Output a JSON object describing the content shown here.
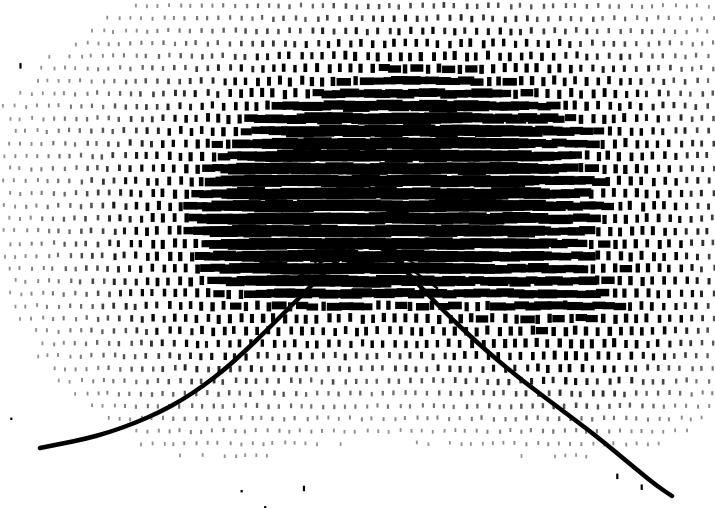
{
  "figure": {
    "title": "",
    "kind": "stipple-density-field-with-overlaid-curve",
    "width": 715,
    "height": 508,
    "background_color": "#ffffff",
    "ink_color": "#000000",
    "has_axes": false,
    "has_tick_labels": false,
    "has_legend": false,
    "has_text_labels": false
  },
  "chart_data": {
    "type": "scatter",
    "title": "",
    "subtitle": "",
    "xlabel": "",
    "ylabel": "",
    "xlim": [
      0,
      715
    ],
    "ylim": [
      508,
      0
    ],
    "grid": false,
    "legend_position": "none",
    "annotations": [],
    "series": [
      {
        "name": "density-stipple-field",
        "render": "dash-marks",
        "mark_shape": "vertical-dash",
        "mark_width_px": 3,
        "mark_height_px": 7,
        "grid_pitch_x": 11,
        "grid_pitch_y": 12.5,
        "color": "#000000",
        "field_model": "anisotropic-gaussian-blob-sum",
        "blobs": [
          {
            "cx": 415,
            "cy": 175,
            "sx": 255,
            "sy": 135,
            "amp": 0.78
          },
          {
            "cx": 370,
            "cy": 215,
            "sx": 175,
            "sy": 110,
            "amp": 0.72
          },
          {
            "cx": 350,
            "cy": 205,
            "sx": 95,
            "sy": 62,
            "amp": 1.05
          },
          {
            "cx": 320,
            "cy": 230,
            "sx": 62,
            "sy": 40,
            "amp": 0.95
          },
          {
            "cx": 470,
            "cy": 120,
            "sx": 190,
            "sy": 95,
            "amp": 0.42
          },
          {
            "cx": 610,
            "cy": 300,
            "sx": 110,
            "sy": 90,
            "amp": 0.4
          },
          {
            "cx": 215,
            "cy": 300,
            "sx": 120,
            "sy": 110,
            "amp": 0.38
          },
          {
            "cx": 540,
            "cy": 330,
            "sx": 130,
            "sy": 85,
            "amp": 0.3
          }
        ],
        "saturation_threshold": 0.86,
        "stripe_period_y": 12.5,
        "noise_amount": 0.3,
        "sparse_outlier_count": 95
      }
    ],
    "overlay_curve": {
      "name": "peak-curve",
      "render": "thick-stroke",
      "stroke_width_px": 4.5,
      "color": "#000000",
      "description": "smooth single-peaked curve rising from lower-left, apex near center, descending to lower-right",
      "points": [
        [
          40,
          448
        ],
        [
          60,
          444
        ],
        [
          85,
          439
        ],
        [
          110,
          432
        ],
        [
          135,
          423
        ],
        [
          160,
          412
        ],
        [
          182,
          400
        ],
        [
          203,
          386
        ],
        [
          224,
          370
        ],
        [
          244,
          352
        ],
        [
          263,
          334
        ],
        [
          281,
          316
        ],
        [
          298,
          299
        ],
        [
          314,
          283
        ],
        [
          329,
          268
        ],
        [
          342,
          257
        ],
        [
          352,
          249
        ],
        [
          360,
          243
        ],
        [
          365,
          240
        ],
        [
          371,
          241
        ],
        [
          379,
          246
        ],
        [
          390,
          255
        ],
        [
          403,
          268
        ],
        [
          418,
          284
        ],
        [
          434,
          301
        ],
        [
          451,
          318
        ],
        [
          469,
          335
        ],
        [
          488,
          352
        ],
        [
          507,
          368
        ],
        [
          527,
          384
        ],
        [
          547,
          399
        ],
        [
          567,
          414
        ],
        [
          587,
          429
        ],
        [
          606,
          444
        ],
        [
          624,
          459
        ],
        [
          641,
          473
        ],
        [
          657,
          486
        ],
        [
          672,
          496
        ]
      ]
    },
    "secondary_lines": [
      {
        "name": "inner-vee-1",
        "stroke_width_px": 2.5,
        "color": "#000000",
        "points": [
          [
            292,
            281
          ],
          [
            327,
            258
          ],
          [
            352,
            245
          ],
          [
            365,
            240
          ],
          [
            378,
            246
          ],
          [
            404,
            264
          ],
          [
            437,
            288
          ]
        ]
      },
      {
        "name": "inner-vee-2",
        "stroke_width_px": 2.0,
        "color": "#000000",
        "points": [
          [
            315,
            262
          ],
          [
            343,
            247
          ],
          [
            365,
            239
          ],
          [
            387,
            247
          ],
          [
            415,
            264
          ]
        ]
      },
      {
        "name": "inner-vee-3",
        "stroke_width_px": 1.8,
        "color": "#000000",
        "points": [
          [
            334,
            250
          ],
          [
            352,
            242
          ],
          [
            365,
            238
          ],
          [
            379,
            242
          ],
          [
            397,
            251
          ]
        ]
      }
    ]
  }
}
